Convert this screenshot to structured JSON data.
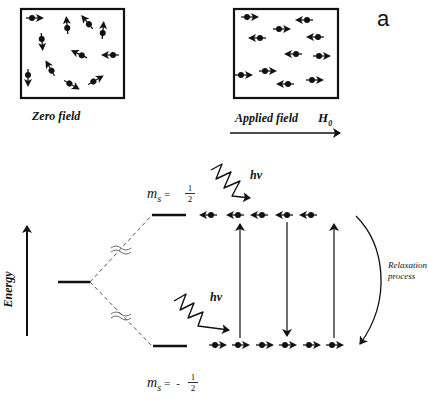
{
  "figure": {
    "panel_label": "a",
    "top_panels": [
      {
        "id": "zero-field",
        "caption": "Zero field",
        "box": {
          "x": 21,
          "y": 9,
          "w": 103,
          "h": 89
        },
        "spins": [
          {
            "x": 35,
            "y": 18,
            "angle": 0
          },
          {
            "x": 67,
            "y": 25,
            "angle": -95
          },
          {
            "x": 87,
            "y": 22,
            "angle": -130
          },
          {
            "x": 103,
            "y": 30,
            "angle": -85
          },
          {
            "x": 42,
            "y": 42,
            "angle": 85
          },
          {
            "x": 79,
            "y": 54,
            "angle": -155
          },
          {
            "x": 110,
            "y": 55,
            "angle": 180
          },
          {
            "x": 50,
            "y": 68,
            "angle": -120
          },
          {
            "x": 28,
            "y": 78,
            "angle": 90
          },
          {
            "x": 72,
            "y": 85,
            "angle": 30
          },
          {
            "x": 96,
            "y": 80,
            "angle": -30
          }
        ]
      },
      {
        "id": "applied-field",
        "caption": "Applied field",
        "field_symbol": "H",
        "field_subscript": "0",
        "box": {
          "x": 234,
          "y": 9,
          "w": 104,
          "h": 89
        },
        "spins": [
          {
            "x": 250,
            "y": 17,
            "angle": 0
          },
          {
            "x": 304,
            "y": 20,
            "angle": 180
          },
          {
            "x": 282,
            "y": 29,
            "angle": 0
          },
          {
            "x": 257,
            "y": 38,
            "angle": 180
          },
          {
            "x": 315,
            "y": 37,
            "angle": 180
          },
          {
            "x": 293,
            "y": 54,
            "angle": 180
          },
          {
            "x": 322,
            "y": 56,
            "angle": 0
          },
          {
            "x": 244,
            "y": 75,
            "angle": 0
          },
          {
            "x": 268,
            "y": 71,
            "angle": 0
          },
          {
            "x": 285,
            "y": 84,
            "angle": 180
          },
          {
            "x": 315,
            "y": 80,
            "angle": 0
          }
        ]
      }
    ],
    "energy_diagram": {
      "axis_label": "Energy",
      "upper_level": {
        "label_symbol": "m",
        "label_subscript": "s",
        "equals": "=",
        "sign": "",
        "numerator": "1",
        "denominator": "2",
        "spins_x": [
          208,
          235,
          259,
          284,
          308
        ],
        "y": 215
      },
      "lower_level": {
        "label_symbol": "m",
        "label_subscript": "s",
        "equals": "=",
        "sign": "-",
        "numerator": "1",
        "denominator": "2",
        "spins_x": [
          218,
          241,
          265,
          288,
          312,
          335
        ],
        "y": 345
      },
      "photon_label": "hν",
      "relaxation_label_line1": "Relaxation",
      "relaxation_label_line2": "process",
      "transitions": [
        {
          "x": 240,
          "direction": "up"
        },
        {
          "x": 287,
          "direction": "down"
        },
        {
          "x": 334,
          "direction": "up"
        }
      ]
    },
    "colors": {
      "ink": "#111111",
      "dashed": "#555555",
      "background": "#ffffff"
    }
  }
}
